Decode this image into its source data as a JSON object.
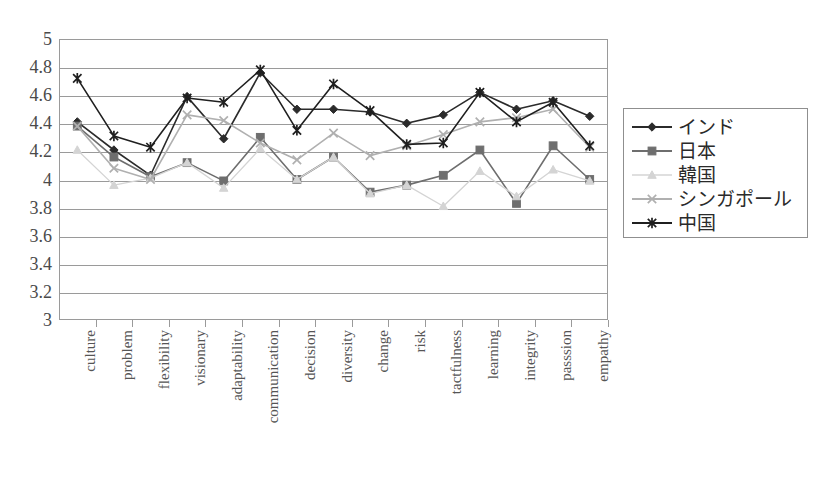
{
  "chart_data": {
    "type": "line",
    "title": "",
    "xlabel": "",
    "ylabel": "",
    "ylim": [
      3,
      5
    ],
    "ytick_step": 0.2,
    "grid": true,
    "legend_position": "right",
    "categories": [
      "culture",
      "problem",
      "flexibility",
      "visionary",
      "adaptability",
      "communication",
      "decision",
      "diversity",
      "change",
      "risk",
      "tactfulness",
      "learning",
      "integrity",
      "passsion",
      "empathy"
    ],
    "ytick_labels": [
      "5",
      "4.8",
      "4.6",
      "4.4",
      "4.2",
      "4",
      "3.8",
      "3.6",
      "3.4",
      "3.2",
      "3"
    ],
    "series": [
      {
        "name": "インド",
        "marker": "diamond",
        "color": "#2b2b2b",
        "values": [
          4.41,
          4.21,
          4.03,
          4.59,
          4.29,
          4.76,
          4.5,
          4.5,
          4.48,
          4.4,
          4.46,
          4.62,
          4.5,
          4.56,
          4.45
        ]
      },
      {
        "name": "日本",
        "marker": "square",
        "color": "#6e6e6e",
        "values": [
          4.38,
          4.16,
          4.02,
          4.12,
          3.99,
          4.3,
          4.0,
          4.16,
          3.91,
          3.96,
          4.03,
          4.21,
          3.83,
          4.24,
          4.0
        ]
      },
      {
        "name": "韓国",
        "marker": "triangle",
        "color": "#d4d4d4",
        "values": [
          4.21,
          3.96,
          4.01,
          4.12,
          3.94,
          4.22,
          4.0,
          4.16,
          3.9,
          3.96,
          3.81,
          4.06,
          3.88,
          4.07,
          3.99
        ]
      },
      {
        "name": "シンガポール",
        "marker": "cross",
        "color": "#b0b0b0",
        "values": [
          4.38,
          4.08,
          4.0,
          4.46,
          4.42,
          4.26,
          4.14,
          4.33,
          4.17,
          4.24,
          4.32,
          4.41,
          4.44,
          4.5,
          4.23
        ]
      },
      {
        "name": "中国",
        "marker": "asterisk",
        "color": "#1f1f1f",
        "values": [
          4.72,
          4.31,
          4.23,
          4.58,
          4.55,
          4.78,
          4.35,
          4.68,
          4.49,
          4.25,
          4.26,
          4.62,
          4.41,
          4.55,
          4.24
        ]
      }
    ]
  }
}
